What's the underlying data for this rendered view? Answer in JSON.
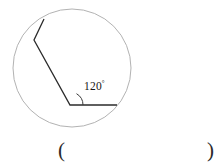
{
  "figure": {
    "name": "circle-with-inscribed-angle",
    "angle_label": {
      "value": "120",
      "degree_symbol": "°",
      "full_text": "120°",
      "x": 84,
      "y": 80
    },
    "circle": {
      "center_x": 72,
      "center_y": 68,
      "radius": 59,
      "stroke": "#a9a9a9",
      "stroke_width": 0.9,
      "fill": "none"
    },
    "polyline": {
      "stroke": "#2b2b2b",
      "stroke_width": 1.3,
      "points": [
        {
          "x": 44,
          "y": 19
        },
        {
          "x": 34,
          "y": 40
        },
        {
          "x": 70,
          "y": 105
        },
        {
          "x": 117,
          "y": 105
        }
      ],
      "points_attr": "44,19 34,40 70,105 117,105"
    },
    "angle_arc": {
      "vertex_x": 70,
      "vertex_y": 105,
      "radius": 13,
      "stroke": "#3a3a3a",
      "stroke_width": 1,
      "path_d": "M 83 105 A 13 13 0 0 0 76.5 93.7"
    }
  },
  "answer": {
    "open_paren": "(",
    "close_paren": ")",
    "value": ""
  }
}
